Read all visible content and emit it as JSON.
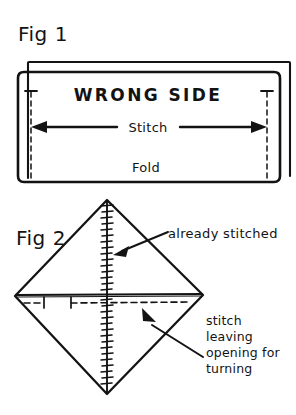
{
  "page": {
    "background_color": "#ffffff",
    "ink_color": "#131313",
    "width": 296,
    "height": 415
  },
  "figure1": {
    "label": "Fig 1",
    "fabric_label": "WRONG SIDE",
    "stitch_label": "Stitch",
    "fold_label": "Fold",
    "icons": {
      "arrow_left": "arrow-left-icon",
      "arrow_right": "arrow-right-icon",
      "seam_allowance_left": "dashed-seam-line-icon",
      "seam_allowance_right": "dashed-seam-line-icon"
    }
  },
  "figure2": {
    "label": "Fig 2",
    "annotation_already_stitched": "already stitched",
    "annotation_opening_lines": [
      "stitch",
      "leaving",
      "opening for",
      "turning"
    ],
    "icons": {
      "pointer_already_stitched": "arrow-pointer-icon",
      "pointer_opening": "arrow-pointer-icon",
      "stitch_line": "stitch-hatch-line-icon",
      "opening_seam": "dashed-seam-line-icon"
    }
  },
  "diagram_data": {
    "type": "diagram",
    "title": "Sewing instructions: folded rectangle and diamond",
    "figures": [
      {
        "name": "Fig 1",
        "shape": "folded rectangle with back layer offset",
        "front_rect": {
          "x": 18,
          "y": 72,
          "width": 262,
          "height": 110
        },
        "back_rect_offset": {
          "dx": 10,
          "dy": -10
        },
        "seam_lines_x": [
          31,
          267
        ],
        "stitch_arrow_y": 127,
        "labels": {
          "WRONG SIDE": {
            "x": 148,
            "y": 101
          },
          "Stitch": {
            "x": 148,
            "y": 131
          },
          "Fold": {
            "x": 146,
            "y": 170
          }
        }
      },
      {
        "name": "Fig 2",
        "shape": "square rotated 45 degrees (diamond)",
        "top": {
          "x": 107,
          "y": 200
        },
        "right": {
          "x": 203,
          "y": 295
        },
        "bottom": {
          "x": 107,
          "y": 394
        },
        "left": {
          "x": 15,
          "y": 296
        },
        "center_stitch_line": {
          "x": 107,
          "y1": 200,
          "y2": 394
        },
        "waist_line_y": 294,
        "opening_dashed_line_y": 303,
        "opening_gap": {
          "x_start": 37,
          "x_end": 69
        }
      }
    ]
  }
}
